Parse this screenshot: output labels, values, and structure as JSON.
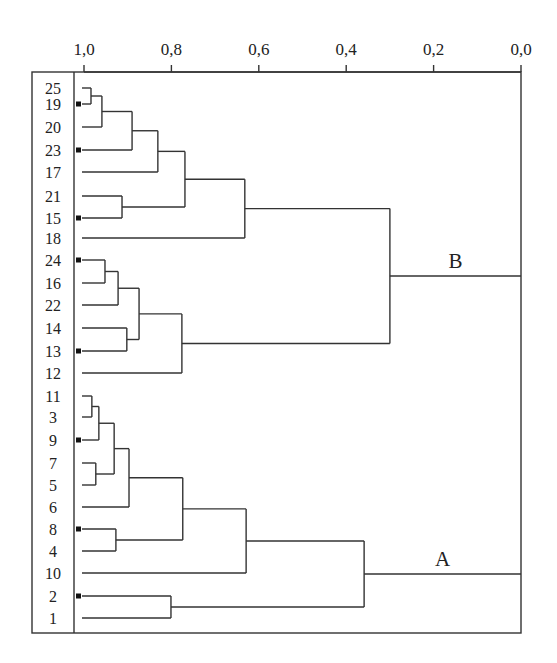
{
  "chart_data": {
    "type": "dendrogram",
    "title": "",
    "xlabel": "",
    "ylabel": "",
    "axis": {
      "position": "top",
      "xlim": [
        1.0,
        0.0
      ],
      "ticks": [
        1.0,
        0.8,
        0.6,
        0.4,
        0.2,
        0.0
      ],
      "tick_labels": [
        "1,0",
        "0,8",
        "0,6",
        "0,4",
        "0,2",
        "0,0"
      ]
    },
    "grid": false,
    "leaves": [
      "25",
      "19",
      "20",
      "23",
      "17",
      "21",
      "15",
      "18",
      "24",
      "16",
      "22",
      "14",
      "13",
      "12",
      "11",
      "3",
      "9",
      "7",
      "5",
      "6",
      "8",
      "4",
      "10",
      "2",
      "1"
    ],
    "marked_leaves": [
      "19",
      "23",
      "15",
      "24",
      "13",
      "9",
      "8",
      "2"
    ],
    "merges": [
      {
        "id": "m1",
        "children": [
          "25",
          "19"
        ],
        "height": 0.984
      },
      {
        "id": "m2",
        "children": [
          "m1",
          "20"
        ],
        "height": 0.959
      },
      {
        "id": "m3",
        "children": [
          "m2",
          "23"
        ],
        "height": 0.89
      },
      {
        "id": "m4",
        "children": [
          "m3",
          "17"
        ],
        "height": 0.831
      },
      {
        "id": "m5",
        "children": [
          "21",
          "15"
        ],
        "height": 0.913
      },
      {
        "id": "m6",
        "children": [
          "m4",
          "m5"
        ],
        "height": 0.769
      },
      {
        "id": "m7",
        "children": [
          "m6",
          "18"
        ],
        "height": 0.632
      },
      {
        "id": "m8",
        "children": [
          "24",
          "16"
        ],
        "height": 0.952
      },
      {
        "id": "m9",
        "children": [
          "m8",
          "22"
        ],
        "height": 0.922
      },
      {
        "id": "m10",
        "children": [
          "14",
          "13"
        ],
        "height": 0.902
      },
      {
        "id": "m11",
        "children": [
          "m9",
          "m10"
        ],
        "height": 0.874
      },
      {
        "id": "m12",
        "children": [
          "m11",
          "12"
        ],
        "height": 0.776
      },
      {
        "id": "B",
        "children": [
          "m7",
          "m12"
        ],
        "height": 0.3
      },
      {
        "id": "m13",
        "children": [
          "11",
          "3"
        ],
        "height": 0.982
      },
      {
        "id": "m14",
        "children": [
          "m13",
          "9"
        ],
        "height": 0.966
      },
      {
        "id": "m15",
        "children": [
          "7",
          "5"
        ],
        "height": 0.973
      },
      {
        "id": "m16",
        "children": [
          "m14",
          "m15"
        ],
        "height": 0.931
      },
      {
        "id": "m17",
        "children": [
          "m16",
          "6"
        ],
        "height": 0.897
      },
      {
        "id": "m18",
        "children": [
          "8",
          "4"
        ],
        "height": 0.927
      },
      {
        "id": "m19",
        "children": [
          "m17",
          "m18"
        ],
        "height": 0.774
      },
      {
        "id": "m20",
        "children": [
          "m19",
          "10"
        ],
        "height": 0.629
      },
      {
        "id": "m21",
        "children": [
          "2",
          "1"
        ],
        "height": 0.801
      },
      {
        "id": "A",
        "children": [
          "m20",
          "m21"
        ],
        "height": 0.359
      }
    ],
    "cluster_labels": [
      {
        "text": "B",
        "merge": "B"
      },
      {
        "text": "A",
        "merge": "A"
      }
    ]
  }
}
